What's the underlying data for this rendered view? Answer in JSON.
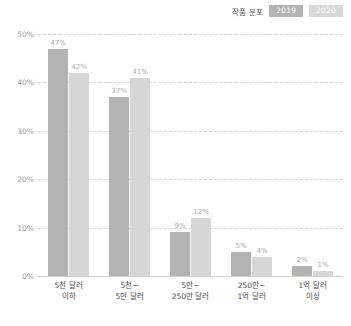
{
  "legend": {
    "title": "작품 분포",
    "items": [
      {
        "label": "2019",
        "color": "#b3b3b3"
      },
      {
        "label": "2020",
        "color": "#d6d6d6"
      }
    ]
  },
  "chart_data": {
    "type": "bar",
    "title": "작품 분포",
    "xlabel": "",
    "ylabel": "",
    "ylim": [
      0,
      50
    ],
    "grid": true,
    "legend_position": "top-right",
    "categories": [
      "5천 달러 이하",
      "5천~ 5만 달러",
      "5만~ 250만 달러",
      "250만~ 1억 달러",
      "1억 달러 이상"
    ],
    "category_lines": [
      [
        "5천 달러",
        "이하"
      ],
      [
        "5천~",
        "5만 달러"
      ],
      [
        "5만~",
        "250만 달러"
      ],
      [
        "250만~",
        "1억 달러"
      ],
      [
        "1억 달러",
        "이상"
      ]
    ],
    "yticks": [
      "0%",
      "10%",
      "20%",
      "30%",
      "40%",
      "50%"
    ],
    "ytick_values": [
      0,
      10,
      20,
      30,
      40,
      50
    ],
    "series": [
      {
        "name": "2019",
        "color": "#b3b3b3",
        "values": [
          47,
          37,
          9,
          5,
          2
        ],
        "labels": [
          "47%",
          "37%",
          "9%",
          "5%",
          "2%"
        ]
      },
      {
        "name": "2020",
        "color": "#d6d6d6",
        "values": [
          42,
          41,
          12,
          4,
          1
        ],
        "labels": [
          "42%",
          "41%",
          "12%",
          "4%",
          "1%"
        ]
      }
    ]
  }
}
